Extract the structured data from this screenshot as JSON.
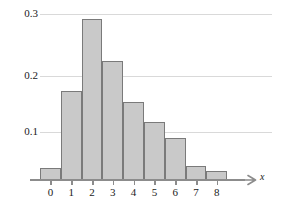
{
  "chart_data": {
    "type": "bar",
    "title": "",
    "subtitle": "",
    "xlabel": "x",
    "ylabel": "",
    "categories": [
      "0",
      "1",
      "2",
      "3",
      "4",
      "5",
      "6",
      "7",
      "8"
    ],
    "values": [
      0.021,
      0.153,
      0.278,
      0.205,
      0.135,
      0.1,
      0.072,
      0.025,
      0.016
    ],
    "series": [
      {
        "name": "relative frequency",
        "values": [
          0.021,
          0.153,
          0.278,
          0.205,
          0.135,
          0.1,
          0.072,
          0.025,
          0.016
        ]
      }
    ],
    "xlim": [
      -0.5,
      8.5
    ],
    "ylim": [
      0,
      0.31
    ],
    "yticks": [
      0.1,
      0.2,
      0.3
    ],
    "ytick_labels": [
      "0.1",
      "0.2",
      "0.3"
    ],
    "xticks": [
      0,
      1,
      2,
      3,
      4,
      5,
      6,
      7,
      8
    ],
    "xtick_labels": [
      "0",
      "1",
      "2",
      "3",
      "4",
      "5",
      "6",
      "7",
      "8"
    ],
    "grid": "horizontal",
    "legend": "none",
    "annotations": [],
    "bar_fill_color": "#c9c9c9",
    "bar_edge_color": "#7a7a7a",
    "gridline_color": "#d9d9d9",
    "axis_color": "#8c8c8c",
    "axis_arrow": "right-arrow-icon"
  },
  "axis": {
    "x_title": "x",
    "y_labels": [
      "0.3",
      "0.2",
      "0.1"
    ],
    "x_labels": [
      "0",
      "1",
      "2",
      "3",
      "4",
      "5",
      "6",
      "7",
      "8"
    ]
  }
}
